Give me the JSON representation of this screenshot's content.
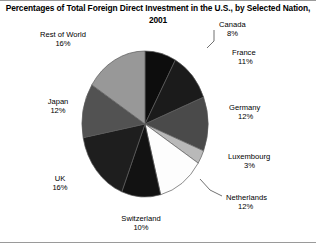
{
  "chart_data": {
    "type": "pie",
    "title": "Percentages of Total Foreign Direct Investment in the U.S., by Selected Nation, 2001",
    "title_line1": "Percentages of Total Foreign Direct Investment in the U.S., by Selected",
    "title_line2": "Nation, 2001",
    "xlabel": "",
    "ylabel": "",
    "legend": "none",
    "grid": false,
    "units": "percent",
    "categories": [
      "Canada",
      "France",
      "Germany",
      "Luxembourg",
      "Netherlands",
      "Switzerland",
      "UK",
      "Japan",
      "Rest of World"
    ],
    "values": [
      8,
      11,
      12,
      3,
      12,
      10,
      16,
      12,
      16
    ],
    "slices": [
      {
        "name": "Canada",
        "value": 8,
        "value_label": "8%",
        "color": "#0d0d0d"
      },
      {
        "name": "France",
        "value": 11,
        "value_label": "11%",
        "color": "#1b1b1b"
      },
      {
        "name": "Germany",
        "value": 12,
        "value_label": "12%",
        "color": "#4a4a4a"
      },
      {
        "name": "Luxembourg",
        "value": 3,
        "value_label": "3%",
        "color": "#b9b9b9"
      },
      {
        "name": "Netherlands",
        "value": 12,
        "value_label": "12%",
        "color": "#fdfdfd"
      },
      {
        "name": "Switzerland",
        "value": 10,
        "value_label": "10%",
        "color": "#121212"
      },
      {
        "name": "UK",
        "value": 16,
        "value_label": "16%",
        "color": "#1e1e1e"
      },
      {
        "name": "Japan",
        "value": 12,
        "value_label": "12%",
        "color": "#525252"
      },
      {
        "name": "Rest of World",
        "value": 16,
        "value_label": "16%",
        "color": "#989898"
      }
    ]
  }
}
